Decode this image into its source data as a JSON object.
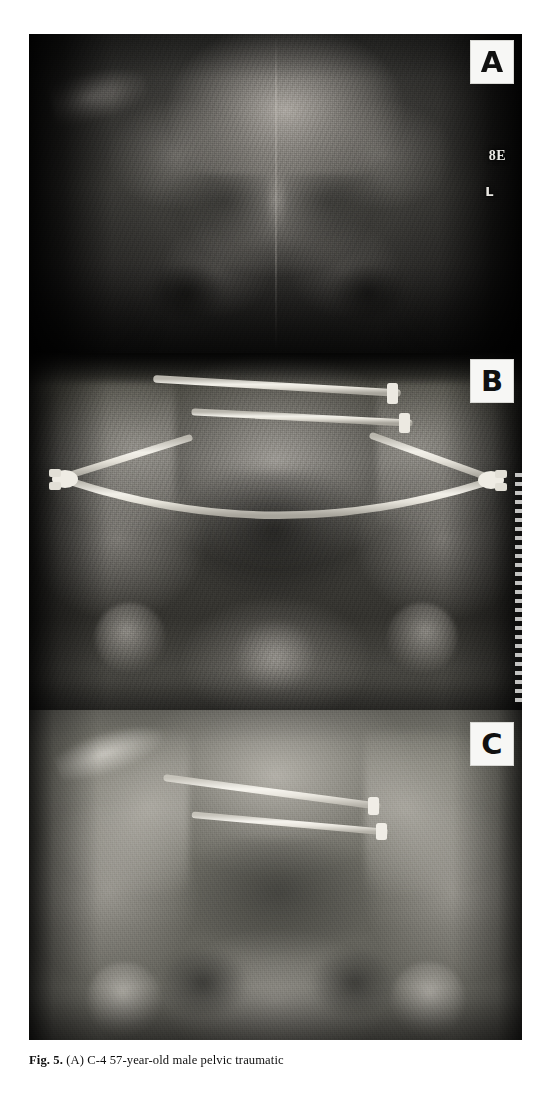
{
  "figure": {
    "id": "figure-5",
    "caption_prefix": "Fig. 5.",
    "caption_text": "(A) C-4 57-year-old male pelvic traumatic",
    "panels": [
      {
        "key": "a",
        "label": "A",
        "badge_name": "panel-label-a",
        "modality": "radiograph",
        "view": "AP pelvis",
        "stage": "initial injury film",
        "exposure": "underexposed / dark",
        "hardware": "none",
        "markers": [
          {
            "name": "film-marker-8e",
            "text": "8E"
          },
          {
            "name": "film-marker-l",
            "text": "L"
          }
        ]
      },
      {
        "key": "b",
        "label": "B",
        "badge_name": "panel-label-b",
        "modality": "radiograph",
        "view": "AP pelvis",
        "stage": "external fixator in situ",
        "exposure": "mid exposure",
        "hardware": "anterior pelvic external fixator with two transiliac screws, two angled half-pins, paired pin clamps and a curved connecting bar",
        "markers": []
      },
      {
        "key": "c",
        "label": "C",
        "badge_name": "panel-label-c",
        "modality": "radiograph",
        "view": "AP pelvis",
        "stage": "follow-up after fixator removal",
        "exposure": "bright / well penetrated",
        "hardware": "two retained iliosacral screws",
        "markers": []
      }
    ]
  },
  "colors": {
    "page_background": "#ffffff",
    "badge_background": "#f7f7f5",
    "badge_text": "#111111",
    "metal_bright": "#e8e6df",
    "metal_mid": "#cfccc3",
    "caption_text": "#111111"
  }
}
